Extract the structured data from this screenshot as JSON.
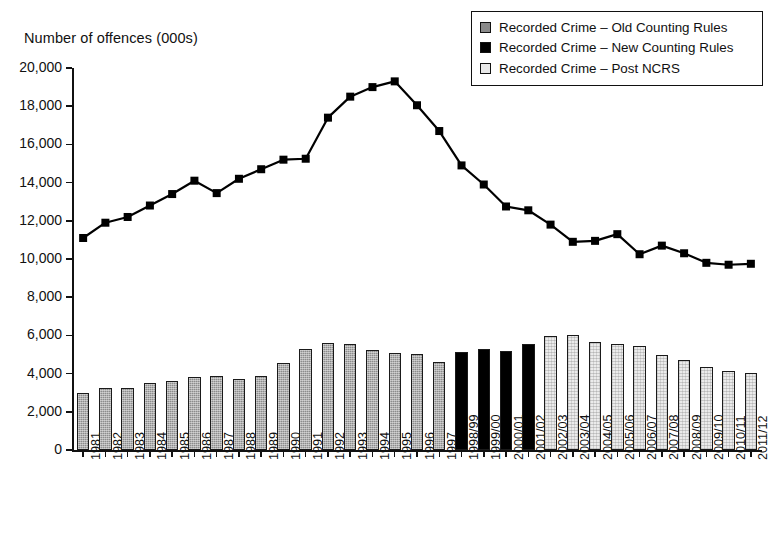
{
  "axis_title": "Number of offences (000s)",
  "legend": {
    "items": [
      {
        "label": "Recorded Crime – Old Counting Rules",
        "swatch": "old-counting-rules-swatch",
        "color": "#8a8a8a"
      },
      {
        "label": "Recorded Crime – New Counting Rules",
        "swatch": "new-counting-rules-swatch",
        "color": "#000000"
      },
      {
        "label": "Recorded Crime – Post NCRS",
        "swatch": "post-ncrs-swatch",
        "color": "#e8e8e8"
      }
    ]
  },
  "chart_data": {
    "type": "bar",
    "title": "",
    "subtitle": "",
    "xlabel": "",
    "ylabel": "Number of offences (000s)",
    "ylim": [
      0,
      20000
    ],
    "ytick_labels": [
      "20,000",
      "18,000",
      "16,000",
      "14,000",
      "12,000",
      "10,000",
      "8,000",
      "6,000",
      "4,000",
      "2,000",
      "0"
    ],
    "ytick_values": [
      20000,
      18000,
      16000,
      14000,
      12000,
      10000,
      8000,
      6000,
      4000,
      2000,
      0
    ],
    "grid": false,
    "legend_position": "top-right",
    "categories": [
      "1981",
      "1982",
      "1983",
      "1984",
      "1985",
      "1986",
      "1987",
      "1988",
      "1989",
      "1990",
      "1991",
      "1992",
      "1993",
      "1994",
      "1995",
      "1996",
      "1997",
      "1998/99",
      "1999/00",
      "2000/01",
      "2001/02",
      "2002/03",
      "2003/04",
      "2004/05",
      "2005/06",
      "2006/07",
      "2007/08",
      "2008/09",
      "2009/10",
      "2010/11",
      "2011/12"
    ],
    "series": [
      {
        "name": "Recorded Crime – Old Counting Rules",
        "type": "bar",
        "color": "#8a8a8a",
        "values": [
          2964,
          3262,
          3247,
          3499,
          3612,
          3847,
          3892,
          3716,
          3870,
          4544,
          5276,
          5592,
          5526,
          5253,
          5100,
          5036,
          4598,
          null,
          null,
          null,
          null,
          null,
          null,
          null,
          null,
          null,
          null,
          null,
          null,
          null,
          null
        ]
      },
      {
        "name": "Recorded Crime – New Counting Rules",
        "type": "bar",
        "color": "#000000",
        "values": [
          null,
          null,
          null,
          null,
          null,
          null,
          null,
          null,
          null,
          null,
          null,
          null,
          null,
          null,
          null,
          null,
          null,
          5109,
          5301,
          5171,
          5525,
          null,
          null,
          null,
          null,
          null,
          null,
          null,
          null,
          null,
          null
        ]
      },
      {
        "name": "Recorded Crime – Post NCRS",
        "type": "bar",
        "color": "#e8e8e8",
        "values": [
          null,
          null,
          null,
          null,
          null,
          null,
          null,
          null,
          null,
          null,
          null,
          null,
          null,
          null,
          null,
          null,
          null,
          null,
          null,
          null,
          null,
          5975,
          6014,
          5637,
          5555,
          5428,
          4951,
          4703,
          4338,
          4150,
          4051
        ]
      },
      {
        "name": "Recorded Crime line (all offences)",
        "type": "line",
        "color": "#000000",
        "marker": "square",
        "values": [
          11100,
          11900,
          12200,
          12800,
          13400,
          14100,
          14600,
          15000,
          15200,
          15300,
          15200,
          17500,
          18500,
          19000,
          19300,
          18000,
          16700,
          14900,
          14000,
          12750,
          12550,
          11800,
          10900,
          10950,
          11300,
          10250,
          10700,
          10300,
          9800,
          9700,
          9750
        ]
      }
    ],
    "line_series_points": [
      {
        "x": "1981",
        "y": 11100
      },
      {
        "x": "1982",
        "y": 11900
      },
      {
        "x": "1983",
        "y": 12200
      },
      {
        "x": "1984",
        "y": 12800
      },
      {
        "x": "1985",
        "y": 13400
      },
      {
        "x": "1986",
        "y": 14100
      },
      {
        "x": "1987",
        "y": 13450
      },
      {
        "x": "1988",
        "y": 14200
      },
      {
        "x": "1989",
        "y": 14700
      },
      {
        "x": "1990",
        "y": 15200
      },
      {
        "x": "1991",
        "y": 15250
      },
      {
        "x": "1992",
        "y": 17400
      },
      {
        "x": "1993",
        "y": 18500
      },
      {
        "x": "1994",
        "y": 19000
      },
      {
        "x": "1995",
        "y": 19300
      },
      {
        "x": "1996",
        "y": 18050
      },
      {
        "x": "1997",
        "y": 16700
      },
      {
        "x": "1998/99",
        "y": 14900
      },
      {
        "x": "1999/00",
        "y": 13900
      },
      {
        "x": "2000/01",
        "y": 12750
      },
      {
        "x": "2001/02",
        "y": 12550
      },
      {
        "x": "2002/03",
        "y": 11800
      },
      {
        "x": "2003/04",
        "y": 10900
      },
      {
        "x": "2004/05",
        "y": 10950
      },
      {
        "x": "2005/06",
        "y": 11300
      },
      {
        "x": "2006/07",
        "y": 10250
      },
      {
        "x": "2007/08",
        "y": 10700
      },
      {
        "x": "2008/09",
        "y": 10300
      },
      {
        "x": "2009/10",
        "y": 9800
      },
      {
        "x": "2010/11",
        "y": 9700
      },
      {
        "x": "2011/12",
        "y": 9750
      }
    ]
  }
}
